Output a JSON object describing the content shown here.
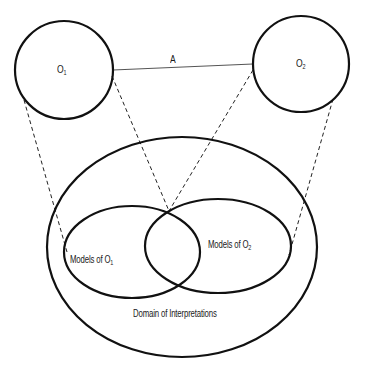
{
  "diagram": {
    "colors": {
      "stroke": "#111111",
      "relation_line": "#555555",
      "background": "#ffffff"
    },
    "ontologies": [
      {
        "label": "O",
        "subscript": "1",
        "cx": 64,
        "cy": 70,
        "r": 49
      },
      {
        "label": "O",
        "subscript": "2",
        "cx": 301,
        "cy": 64,
        "r": 48
      }
    ],
    "relation": {
      "label": "A",
      "from": [
        113,
        70
      ],
      "to": [
        253,
        64
      ]
    },
    "domain": {
      "label": "Domain of Interpretations",
      "cx": 182,
      "cy": 247,
      "rx": 135,
      "ry": 110
    },
    "models": [
      {
        "label_prefix": "Models of O",
        "subscript": "1",
        "cx": 132,
        "cy": 252,
        "rx": 68,
        "ry": 46
      },
      {
        "label_prefix": "Models of O",
        "subscript": "2",
        "cx": 218,
        "cy": 246,
        "rx": 73,
        "ry": 47
      }
    ],
    "mapping_lines": [
      {
        "from": [
          24,
          100
        ],
        "to": [
          67,
          252
        ]
      },
      {
        "from": [
          112,
          76
        ],
        "to": [
          169,
          211
        ]
      },
      {
        "from": [
          253,
          70
        ],
        "to": [
          169,
          211
        ]
      },
      {
        "from": [
          333,
          99
        ],
        "to": [
          289,
          255
        ]
      }
    ]
  }
}
